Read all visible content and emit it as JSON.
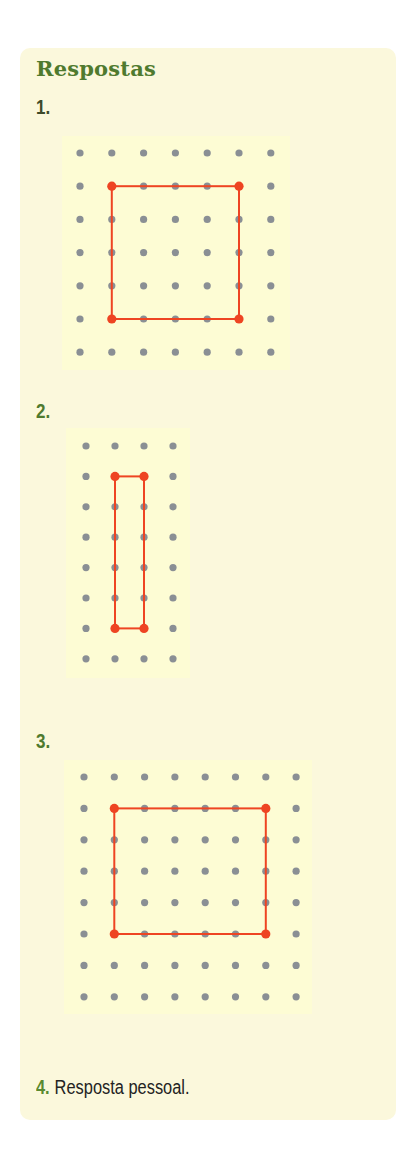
{
  "title": "Respostas",
  "colors": {
    "card_bg": "#fbf8dc",
    "panel_bg": "#fdfcd4",
    "title_green": "#4f7a2e",
    "dot_gray": "#8a8f94",
    "shape_red": "#ee4422"
  },
  "items": [
    {
      "label": "1.",
      "grid": {
        "cols": 7,
        "rows": 7,
        "x0": 80,
        "y0": 153,
        "dx": 31.8,
        "dy": 33.2
      },
      "rectangle": {
        "col_from": 1,
        "col_to": 5,
        "row_from": 1,
        "row_to": 5
      }
    },
    {
      "label": "2.",
      "grid": {
        "cols": 4,
        "rows": 8,
        "x0": 86,
        "y0": 446,
        "dx": 29,
        "dy": 30.4
      },
      "rectangle": {
        "col_from": 1,
        "col_to": 2,
        "row_from": 1,
        "row_to": 6
      }
    },
    {
      "label": "3.",
      "grid": {
        "cols": 8,
        "rows": 8,
        "x0": 84,
        "y0": 777,
        "dx": 30.3,
        "dy": 31.4
      },
      "rectangle": {
        "col_from": 1,
        "col_to": 6,
        "row_from": 1,
        "row_to": 5
      }
    },
    {
      "label": "4.",
      "text": "Resposta pessoal."
    }
  ]
}
